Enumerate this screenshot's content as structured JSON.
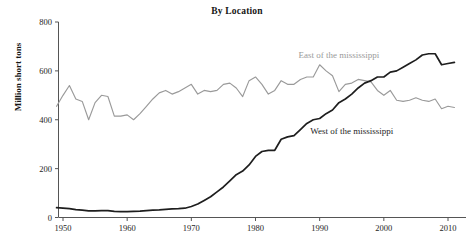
{
  "chart_data": {
    "type": "line",
    "title": "By Location",
    "xlabel": "",
    "ylabel": "Million short tons",
    "xlim": [
      1949,
      2011
    ],
    "ylim": [
      0,
      800
    ],
    "grid": false,
    "legend_position": "inline-annotations",
    "x_ticks": [
      1950,
      1960,
      1970,
      1980,
      1990,
      2000,
      2010
    ],
    "x_tick_labels": [
      "1950",
      "1960",
      "1970",
      "1980",
      "1990",
      "2000",
      "2010"
    ],
    "y_ticks": [
      0,
      200,
      400,
      600,
      800
    ],
    "y_tick_labels": [
      "0",
      "200",
      "400",
      "600",
      "800"
    ],
    "x": [
      1949,
      1950,
      1951,
      1952,
      1953,
      1954,
      1955,
      1956,
      1957,
      1958,
      1959,
      1960,
      1961,
      1962,
      1963,
      1964,
      1965,
      1966,
      1967,
      1968,
      1969,
      1970,
      1971,
      1972,
      1973,
      1974,
      1975,
      1976,
      1977,
      1978,
      1979,
      1980,
      1981,
      1982,
      1983,
      1984,
      1985,
      1986,
      1987,
      1988,
      1989,
      1990,
      1991,
      1992,
      1993,
      1994,
      1995,
      1996,
      1997,
      1998,
      1999,
      2000,
      2001,
      2002,
      2003,
      2004,
      2005,
      2006,
      2007,
      2008,
      2009,
      2010,
      2011
    ],
    "series": [
      {
        "name": "East of the mississippi",
        "color": "#9a9a9a",
        "annotation": "East of the mississippi",
        "values": [
          455,
          500,
          540,
          485,
          475,
          400,
          470,
          500,
          495,
          415,
          415,
          420,
          400,
          425,
          455,
          485,
          510,
          520,
          505,
          515,
          530,
          545,
          505,
          520,
          515,
          520,
          545,
          550,
          530,
          495,
          560,
          575,
          545,
          505,
          520,
          560,
          545,
          545,
          565,
          575,
          575,
          625,
          600,
          580,
          515,
          545,
          550,
          565,
          560,
          555,
          520,
          500,
          520,
          480,
          475,
          480,
          490,
          480,
          475,
          485,
          445,
          455,
          450
        ]
      },
      {
        "name": "West of the mississippi",
        "color": "#1e1e1e",
        "annotation": "West of the mississippi",
        "values": [
          40,
          38,
          36,
          32,
          30,
          27,
          27,
          28,
          28,
          25,
          24,
          24,
          25,
          26,
          28,
          30,
          31,
          33,
          35,
          36,
          38,
          45,
          55,
          70,
          85,
          105,
          125,
          150,
          175,
          190,
          215,
          250,
          270,
          275,
          275,
          320,
          330,
          335,
          360,
          385,
          400,
          405,
          425,
          440,
          470,
          485,
          505,
          530,
          550,
          560,
          575,
          575,
          595,
          600,
          615,
          630,
          645,
          665,
          670,
          670,
          625,
          630,
          635
        ]
      }
    ],
    "annotations": [
      {
        "text": "East of the mississippi",
        "x": 1993,
        "y": 665,
        "color": "#9a9a9a"
      },
      {
        "text": "West of the mississippi",
        "x": 1995,
        "y": 355,
        "color": "#1e1e1e"
      }
    ]
  },
  "axis": {
    "title": "By Location",
    "y_label": "Million short tons"
  }
}
